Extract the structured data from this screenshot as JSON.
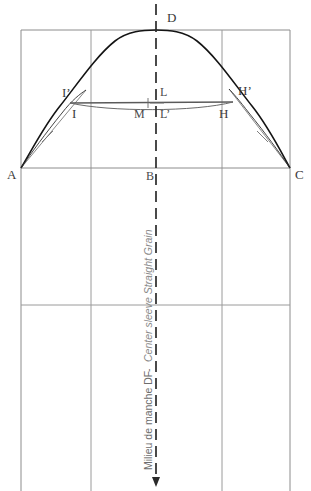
{
  "diagram": {
    "colors": {
      "frame": "#8c8c8c",
      "grid": "#9a9a9a",
      "cap_curve": "#1a1a1a",
      "helper_line": "#6f6f6f",
      "chord_line": "#5a5a5a",
      "dash_axis": "#2b2b2b",
      "label_dark": "#3a3a3a",
      "label_gray": "#6d6d6d",
      "label_italic": "#8a8a8a",
      "background": "#ffffff"
    },
    "points": [
      {
        "id": "A",
        "label": "A",
        "x": 21,
        "y": 168,
        "label_x": 7,
        "label_y": 179
      },
      {
        "id": "B",
        "label": "B",
        "x": 156,
        "y": 168,
        "label_x": 146,
        "label_y": 180
      },
      {
        "id": "C",
        "label": "C",
        "x": 290,
        "y": 168,
        "label_x": 295,
        "label_y": 179
      },
      {
        "id": "D",
        "label": "D",
        "x": 156,
        "y": 30,
        "label_x": 167,
        "label_y": 22
      },
      {
        "id": "I",
        "label": "I",
        "x": 91,
        "y": 103,
        "label_x": 72,
        "label_y": 118
      },
      {
        "id": "Ip",
        "label": "I’",
        "x": 84,
        "y": 93,
        "label_x": 62,
        "label_y": 97
      },
      {
        "id": "H",
        "label": "H",
        "x": 222,
        "y": 103,
        "label_x": 219,
        "label_y": 118
      },
      {
        "id": "Hp",
        "label": "H’",
        "x": 231,
        "y": 92,
        "label_x": 238,
        "label_y": 95
      },
      {
        "id": "L",
        "label": "L",
        "x": 156,
        "y": 103,
        "label_x": 160,
        "label_y": 96
      },
      {
        "id": "Lp",
        "label": "L’",
        "x": 156,
        "y": 107,
        "label_x": 160,
        "label_y": 118
      },
      {
        "id": "M",
        "label": "M",
        "x": 148,
        "y": 103,
        "label_x": 136,
        "label_y": 118
      }
    ],
    "grain_line": {
      "text_fr": "Milieu de manche DF",
      "separator": " - ",
      "text_en": "Center sleeve Straight Grain",
      "full_text": "Milieu de manche DF - Center sleeve Straight Grain",
      "orientation": "vertical-bottom-to-top",
      "arrow_direction": "down",
      "axis_x": 156,
      "axis_top_y": 4,
      "axis_bottom_y": 486
    },
    "frame": {
      "left_x": 21,
      "right_x": 290,
      "top_y": 30,
      "bottom_y": 491,
      "inner_vertical_left_x": 91,
      "inner_vertical_right_x": 222,
      "horizontal_biceps_y": 168,
      "horizontal_lower_y": 305
    },
    "curves": {
      "cap_description": "Sleeve cap curve from A through D to C",
      "chord_description": "Chord line I to H with slight sag",
      "helper_description": "Straight guide lines A-I’ and C-H’ with perpendicular tick marks"
    }
  }
}
